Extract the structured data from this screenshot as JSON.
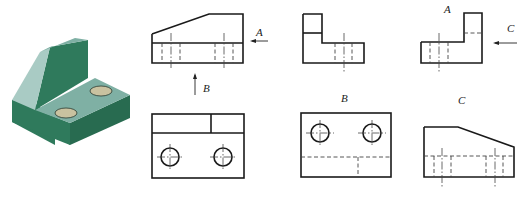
{
  "figure": {
    "isometric": {
      "colors": {
        "top": "#7fb0a4",
        "front": "#2f7a5c",
        "side": "#286b50",
        "slope": "#a9cbc4",
        "hole": "#c9c2a0"
      }
    },
    "views": [
      {
        "id": "main-view",
        "arrows": [
          "A",
          "B"
        ]
      },
      {
        "id": "left-view",
        "label": ""
      },
      {
        "id": "view-A",
        "label": "A",
        "arrows": [
          "C"
        ]
      },
      {
        "id": "top-view",
        "label": ""
      },
      {
        "id": "view-B",
        "label": "B"
      },
      {
        "id": "view-C",
        "label": "C"
      }
    ],
    "labels": {
      "A_arrow": "A",
      "B_arrow": "B",
      "C_arrow": "C",
      "A_view": "A",
      "B_view": "B",
      "C_view": "C"
    }
  }
}
